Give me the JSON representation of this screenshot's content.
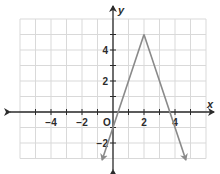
{
  "chart_data": {
    "type": "line",
    "title": "",
    "xlabel": "x",
    "ylabel": "y",
    "xlim": [
      -6,
      6
    ],
    "ylim": [
      -3,
      6
    ],
    "grid": true,
    "origin_label": "O",
    "x_ticks": [
      {
        "value": -4,
        "label": "−4"
      },
      {
        "value": -2,
        "label": "−2"
      },
      {
        "value": 2,
        "label": "2"
      },
      {
        "value": 4,
        "label": "4"
      }
    ],
    "y_ticks": [
      {
        "value": 4,
        "label": "4"
      },
      {
        "value": 2,
        "label": "2"
      },
      {
        "value": -2,
        "label": "−2"
      }
    ],
    "series": [
      {
        "name": "absolute-value-function",
        "description": "Inverted V with vertex at (2, 5); arrows on both ends",
        "points": [
          {
            "x": -0.7,
            "y": -3.1
          },
          {
            "x": 2,
            "y": 5
          },
          {
            "x": 4.7,
            "y": -3.1
          }
        ],
        "vertex": {
          "x": 2,
          "y": 5
        },
        "x_intercepts": [
          0.33,
          3.67
        ],
        "y_intercept": -1,
        "color": "#8a8a8a"
      }
    ]
  }
}
